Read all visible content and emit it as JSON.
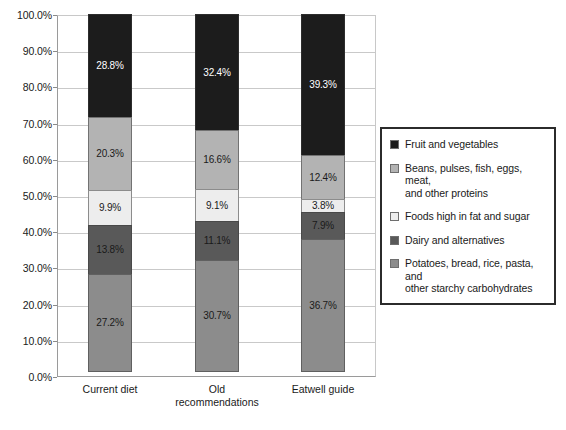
{
  "chart_data": {
    "type": "bar",
    "subtype": "stacked-100-percent",
    "title": "",
    "xlabel": "",
    "ylabel": "",
    "ylim": [
      0,
      100
    ],
    "grid": true,
    "legend_position": "right",
    "categories": [
      "Current diet",
      "Old recommendations",
      "Eatwell guide"
    ],
    "category_label_lines": [
      [
        "Current diet"
      ],
      [
        "Old",
        "recommendations"
      ],
      [
        "Eatwell guide"
      ]
    ],
    "y_ticks": [
      "0.0%",
      "10.0%",
      "20.0%",
      "30.0%",
      "40.0%",
      "50.0%",
      "60.0%",
      "70.0%",
      "80.0%",
      "90.0%",
      "100.0%"
    ],
    "y_tick_values": [
      0,
      10,
      20,
      30,
      40,
      50,
      60,
      70,
      80,
      90,
      100
    ],
    "series": [
      {
        "name": "Potatoes, bread, rice, pasta, and other starchy carbohydrates",
        "color": "#8c8c8c",
        "label_color": "#1a1a1a",
        "values": [
          27.2,
          30.7,
          36.7
        ],
        "labels": [
          "27.2%",
          "30.7%",
          "36.7%"
        ]
      },
      {
        "name": "Dairy and alternatives",
        "color": "#595959",
        "label_color": "#1a1a1a",
        "values": [
          13.8,
          11.1,
          7.9
        ],
        "labels": [
          "13.8%",
          "11.1%",
          "7.9%"
        ]
      },
      {
        "name": "Foods high in fat and sugar",
        "color": "#ededed",
        "label_color": "#1a1a1a",
        "values": [
          9.9,
          9.1,
          3.8
        ],
        "labels": [
          "9.9%",
          "9.1%",
          "3.8%"
        ]
      },
      {
        "name": "Beans, pulses, fish, eggs, meat, and other proteins",
        "color": "#b3b3b3",
        "label_color": "#1a1a1a",
        "values": [
          20.3,
          16.6,
          12.4
        ],
        "labels": [
          "20.3%",
          "16.6%",
          "12.4%"
        ]
      },
      {
        "name": "Fruit and vegetables",
        "color": "#1c1c1c",
        "label_color": "#ffffff",
        "values": [
          28.8,
          32.4,
          39.3
        ],
        "labels": [
          "28.8%",
          "32.4%",
          "39.3%"
        ]
      }
    ],
    "legend_entries": [
      {
        "label": "Fruit and vegetables",
        "lines": [
          "Fruit and vegetables"
        ],
        "color": "#1c1c1c"
      },
      {
        "label": "Beans, pulses, fish, eggs, meat, and other proteins",
        "lines": [
          "Beans, pulses, fish, eggs, meat,",
          "and other proteins"
        ],
        "color": "#b3b3b3"
      },
      {
        "label": "Foods high in fat and sugar",
        "lines": [
          "Foods high in fat and sugar"
        ],
        "color": "#ededed"
      },
      {
        "label": "Dairy and alternatives",
        "lines": [
          "Dairy and alternatives"
        ],
        "color": "#595959"
      },
      {
        "label": "Potatoes, bread, rice, pasta, and other starchy carbohydrates",
        "lines": [
          "Potatoes, bread, rice, pasta, and",
          "other starchy carbohydrates"
        ],
        "color": "#8c8c8c"
      }
    ]
  }
}
